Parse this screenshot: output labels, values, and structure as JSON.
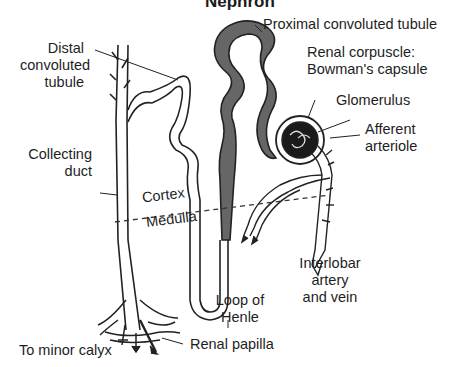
{
  "diagram": {
    "title": "Nephron",
    "colors": {
      "proximal_tubule_fill": "#666666",
      "outline": "#222222",
      "glomerulus_fill": "#1a1a1a",
      "background": "#ffffff"
    },
    "zones": {
      "upper": "Cortex",
      "lower": "Medulla"
    },
    "labels": {
      "distal_line1": "Distal",
      "distal_line2": "convoluted",
      "distal_line3": "tubule",
      "proximal": "Proximal convoluted tubule",
      "corpuscle_line1": "Renal corpuscle:",
      "corpuscle_line2": "Bowman's capsule",
      "glomerulus": "Glomerulus",
      "afferent_line1": "Afferent",
      "afferent_line2": "arteriole",
      "collecting_line1": "Collecting",
      "collecting_line2": "duct",
      "interlobar_line1": "Interlobar",
      "interlobar_line2": "artery",
      "interlobar_line3": "and vein",
      "loop_line1": "Loop of",
      "loop_line2": "Henle",
      "calyx": "To minor calyx",
      "papilla": "Renal papilla"
    }
  }
}
